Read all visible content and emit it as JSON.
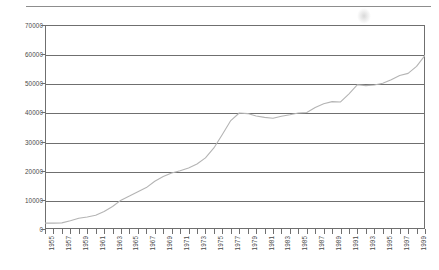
{
  "chart_data": {
    "type": "line",
    "title": "",
    "subtitle": "",
    "xlabel": "",
    "ylabel": "",
    "grid": true,
    "legend_position": "none",
    "xlim": [
      1955,
      2000
    ],
    "ylim": [
      0,
      70000
    ],
    "y_ticks": [
      0,
      10000,
      20000,
      30000,
      40000,
      50000,
      60000,
      70000
    ],
    "y_tick_labels": [
      "0",
      "10000",
      "20000",
      "30000",
      "40000",
      "50000",
      "60000",
      "70000"
    ],
    "x_tick_labels": [
      "1955",
      "1957",
      "1959",
      "1961",
      "1963",
      "1965",
      "1967",
      "1969",
      "1971",
      "1973",
      "1975",
      "1977",
      "1979",
      "1981",
      "1983",
      "1985",
      "1987",
      "1989",
      "1991",
      "1993",
      "1995",
      "1997",
      "1999"
    ],
    "x_tick_label_rotation": -90,
    "x_minor_ticks_every": 1,
    "series": [
      {
        "name": "series-1",
        "color": "#b4b4b4",
        "x": [
          1955,
          1956,
          1957,
          1958,
          1959,
          1960,
          1961,
          1962,
          1963,
          1964,
          1965,
          1966,
          1967,
          1968,
          1969,
          1970,
          1971,
          1972,
          1973,
          1974,
          1975,
          1976,
          1977,
          1978,
          1979,
          1980,
          1981,
          1982,
          1983,
          1984,
          1985,
          1986,
          1987,
          1988,
          1989,
          1990,
          1991,
          1992,
          1993,
          1994,
          1995,
          1996,
          1997,
          1998,
          1999,
          2000
        ],
        "values": [
          2000,
          2000,
          2100,
          2800,
          3700,
          4100,
          4700,
          6000,
          7700,
          9900,
          11300,
          12800,
          14200,
          16400,
          18000,
          19200,
          20000,
          20900,
          22300,
          24400,
          27800,
          32400,
          37200,
          39800,
          39600,
          38800,
          38300,
          38000,
          38700,
          39200,
          39800,
          40000,
          41700,
          43000,
          43700,
          43600,
          46400,
          49500,
          49200,
          49400,
          50000,
          51200,
          52700,
          53400,
          55800,
          59600
        ]
      }
    ]
  },
  "axes": {
    "y_axis_name": "y-axis",
    "x_axis_name": "x-axis"
  },
  "colors": {
    "grid": "#6f6f6f",
    "frame": "#6f6f6f",
    "series": "#b4b4b4",
    "tick_text": "#4a4a4a",
    "page_rule": "#8d8d8d"
  }
}
